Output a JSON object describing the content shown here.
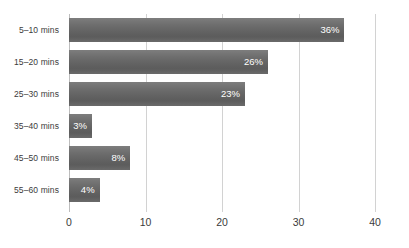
{
  "chart_data": {
    "type": "bar",
    "orientation": "horizontal",
    "title": "",
    "xlabel": "",
    "ylabel": "",
    "xlim": [
      0,
      40
    ],
    "xticks": [
      "0",
      "10",
      "20",
      "30",
      "40"
    ],
    "grid": "vertical",
    "legend": "none",
    "bar_color": "#666666",
    "label_color": "#ffffff",
    "categories": [
      "5–10 mins",
      "15–20 mins",
      "25–30 mins",
      "35–40 mins",
      "45–50 mins",
      "55–60 mins"
    ],
    "values": [
      36,
      26,
      23,
      3,
      8,
      4
    ],
    "data_labels": [
      "36%",
      "26%",
      "23%",
      "3%",
      "8%",
      "4%"
    ]
  }
}
